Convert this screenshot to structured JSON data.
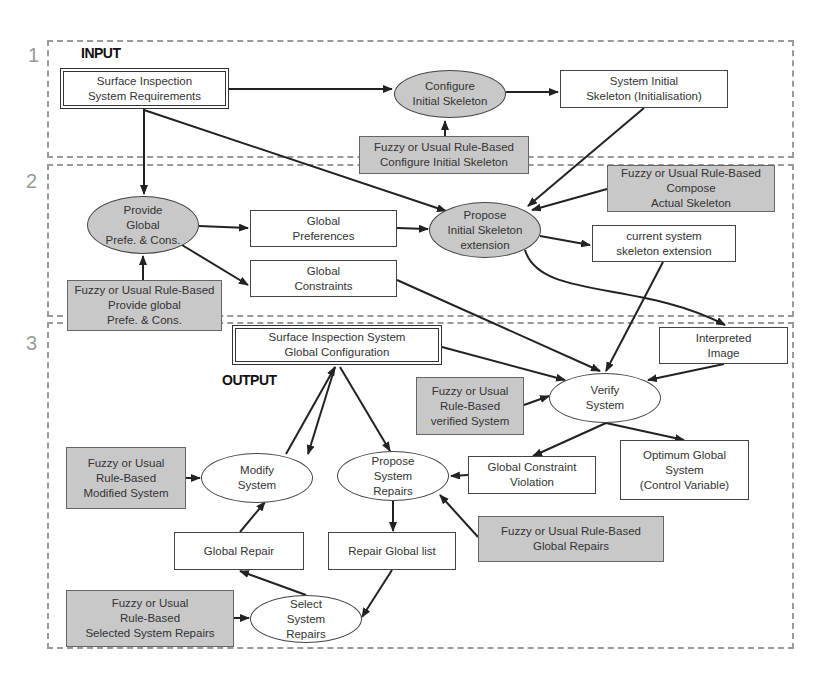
{
  "sections": [
    {
      "number": "1",
      "heading": "INPUT"
    },
    {
      "number": "2"
    },
    {
      "number": "3",
      "heading": "OUTPUT"
    }
  ],
  "nodes": {
    "requirements": "Surface Inspection\nSystem Requirements",
    "configure_skeleton": "Configure\nInitial Skeleton",
    "system_initial_skeleton": "System Initial\nSkeleton (Initialisation)",
    "rule_configure": "Fuzzy or Usual Rule-Based\nConfigure Initial Skeleton",
    "rule_compose": "Fuzzy or Usual Rule-Based\nCompose\nActual Skeleton",
    "provide_global": "Provide\nGlobal\nPrefe. & Cons.",
    "global_preferences": "Global\nPreferences",
    "global_constraints": "Global\nConstraints",
    "rule_provide_global": "Fuzzy or Usual Rule-Based\nProvide global\nPrefe. & Cons.",
    "propose_skeleton": "Propose\nInitial Skeleton\nextension",
    "current_skeleton": "current system\nskeleton extension",
    "interpreted_image": "Interpreted\nImage",
    "global_configuration": "Surface Inspection System\nGlobal Configuration",
    "verify_system": "Verify\nSystem",
    "rule_verified": "Fuzzy or Usual\nRule-Based\nverified System",
    "modify_system": "Modify\nSystem",
    "propose_repairs": "Propose\nSystem\nRepairs",
    "rule_modified": "Fuzzy or Usual\nRule-Based\nModified System",
    "constraint_violation": "Global Constraint\nViolation",
    "optimum_global": "Optimum Global\nSystem\n(Control Variable)",
    "rule_global_repairs": "Fuzzy or Usual Rule-Based\nGlobal Repairs",
    "global_repair": "Global Repair",
    "repair_list": "Repair Global list",
    "rule_selected": "Fuzzy or Usual\nRule-Based\nSelected System Repairs",
    "select_repairs": "Select\nSystem\nRepairs"
  },
  "colors": {
    "rule_fill": "#c8c8c8",
    "section_border": "#9a9a9a",
    "edge": "#222222"
  }
}
